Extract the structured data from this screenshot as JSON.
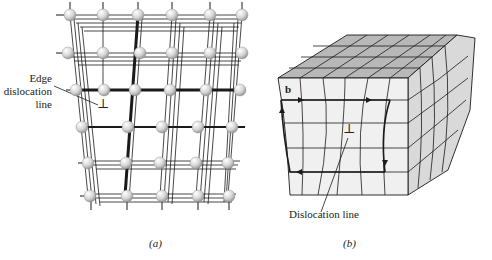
{
  "figure": {
    "panels": [
      {
        "id": "a",
        "caption": "(a)",
        "description": "Atomic lattice with an extra half-plane of atoms (edge dislocation)",
        "labels": {
          "edge_label_line1": "Edge",
          "edge_label_line2": "dislocation",
          "edge_label_line3": "line"
        },
        "symbols": {
          "dislocation_symbol": "⊥"
        }
      },
      {
        "id": "b",
        "caption": "(b)",
        "description": "Block of crystal showing a Burgers circuit around an edge dislocation",
        "labels": {
          "burgers_vector": "b",
          "dislocation_line": "Dislocation line"
        },
        "symbols": {
          "dislocation_symbol": "⊥"
        }
      }
    ],
    "colors": {
      "line": "#1a1a1a",
      "atom_fill": "#dcdcdc",
      "atom_highlight": "#ffffff",
      "block_front": "#f0f0f0",
      "block_top": "#b8b8b8",
      "block_side": "#d9d9d9"
    }
  }
}
